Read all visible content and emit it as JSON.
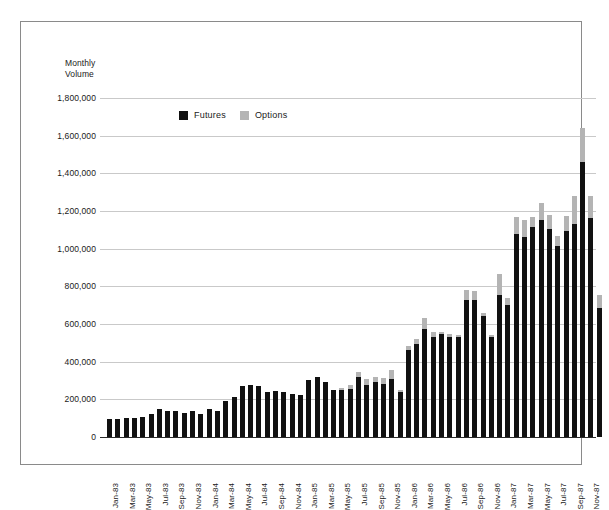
{
  "frame": {
    "border_color": "#8a8a8a"
  },
  "chart_data": {
    "type": "bar",
    "subtype": "stacked-vertical",
    "title": "",
    "axis_title": "Monthly\nVolume",
    "axis_title_line1": "Monthly",
    "axis_title_line2": "Volume",
    "xlabel": "",
    "ylabel": "Monthly Volume",
    "ylim": [
      0,
      1800000
    ],
    "ytick_step": 200000,
    "ytick_labels": [
      "1,800,000",
      "1,600,000",
      "1,400,000",
      "1,200,000",
      "1,000,000",
      "800,000",
      "600,000",
      "400,000",
      "200,000",
      "0"
    ],
    "ytick_values": [
      1800000,
      1600000,
      1400000,
      1200000,
      1000000,
      800000,
      600000,
      400000,
      200000,
      0
    ],
    "grid": true,
    "grid_color": "#c9c9c9",
    "legend_position": "top-left-inside",
    "legend": [
      {
        "name": "Futures",
        "color": "#111111"
      },
      {
        "name": "Options",
        "color": "#b4b4b4"
      }
    ],
    "categories": [
      "Jan-83",
      "Feb-83",
      "Mar-83",
      "Apr-83",
      "May-83",
      "Jun-83",
      "Jul-83",
      "Aug-83",
      "Sep-83",
      "Oct-83",
      "Nov-83",
      "Dec-83",
      "Jan-84",
      "Feb-84",
      "Mar-84",
      "Apr-84",
      "May-84",
      "Jun-84",
      "Jul-84",
      "Aug-84",
      "Sep-84",
      "Oct-84",
      "Nov-84",
      "Dec-84",
      "Jan-85",
      "Feb-85",
      "Mar-85",
      "Apr-85",
      "May-85",
      "Jun-85",
      "Jul-85",
      "Aug-85",
      "Sep-85",
      "Oct-85",
      "Nov-85",
      "Dec-85",
      "Jan-86",
      "Feb-86",
      "Mar-86",
      "Apr-86",
      "May-86",
      "Jun-86",
      "Jul-86",
      "Aug-86",
      "Sep-86",
      "Oct-86",
      "Nov-86",
      "Dec-86",
      "Jan-87",
      "Feb-87",
      "Mar-87",
      "Apr-87",
      "May-87",
      "Jun-87",
      "Jul-87",
      "Aug-87",
      "Sep-87",
      "Oct-87",
      "Nov-87",
      "Dec-87"
    ],
    "tick_labels_shown": [
      "Jan-83",
      "Mar-83",
      "May-83",
      "Jul-83",
      "Sep-83",
      "Nov-83",
      "Jan-84",
      "Mar-84",
      "May-84",
      "Jul-84",
      "Sep-84",
      "Nov-84",
      "Jan-85",
      "Mar-85",
      "May-85",
      "Jul-85",
      "Sep-85",
      "Nov-85",
      "Jan-86",
      "Mar-86",
      "May-86",
      "Jul-86",
      "Sep-86",
      "Nov-86",
      "Jan-87",
      "Mar-87",
      "May-87",
      "Jul-87",
      "Sep-87",
      "Nov-87"
    ],
    "series": [
      {
        "name": "Futures",
        "color": "#111111",
        "values": [
          95000,
          95000,
          100000,
          100000,
          105000,
          120000,
          150000,
          140000,
          140000,
          130000,
          140000,
          120000,
          150000,
          140000,
          190000,
          215000,
          270000,
          275000,
          270000,
          240000,
          245000,
          240000,
          230000,
          225000,
          305000,
          320000,
          290000,
          250000,
          250000,
          255000,
          320000,
          275000,
          290000,
          280000,
          310000,
          240000,
          460000,
          495000,
          575000,
          530000,
          545000,
          530000,
          530000,
          725000,
          730000,
          640000,
          530000,
          755000,
          700000,
          1080000,
          1060000,
          1115000,
          1150000,
          1105000,
          1015000,
          1095000,
          1130000,
          1460000,
          1165000,
          685000
        ]
      },
      {
        "name": "Options",
        "color": "#b4b4b4",
        "values": [
          0,
          0,
          0,
          0,
          0,
          0,
          0,
          0,
          0,
          0,
          0,
          0,
          0,
          0,
          0,
          0,
          0,
          0,
          0,
          0,
          0,
          0,
          0,
          0,
          0,
          0,
          0,
          0,
          10000,
          20000,
          25000,
          35000,
          30000,
          35000,
          45000,
          10000,
          25000,
          25000,
          55000,
          25000,
          10000,
          15000,
          10000,
          55000,
          45000,
          20000,
          10000,
          110000,
          40000,
          90000,
          90000,
          55000,
          95000,
          75000,
          55000,
          80000,
          150000,
          180000,
          115000,
          70000
        ]
      }
    ],
    "totals": [
      95000,
      95000,
      100000,
      100000,
      105000,
      120000,
      150000,
      140000,
      140000,
      130000,
      140000,
      120000,
      150000,
      140000,
      190000,
      215000,
      270000,
      275000,
      270000,
      240000,
      245000,
      240000,
      230000,
      225000,
      305000,
      320000,
      290000,
      250000,
      260000,
      275000,
      345000,
      310000,
      320000,
      315000,
      355000,
      250000,
      485000,
      520000,
      630000,
      555000,
      555000,
      545000,
      540000,
      780000,
      775000,
      660000,
      540000,
      865000,
      740000,
      1170000,
      1150000,
      1170000,
      1245000,
      1180000,
      1070000,
      1175000,
      1280000,
      1640000,
      1280000,
      755000
    ]
  }
}
